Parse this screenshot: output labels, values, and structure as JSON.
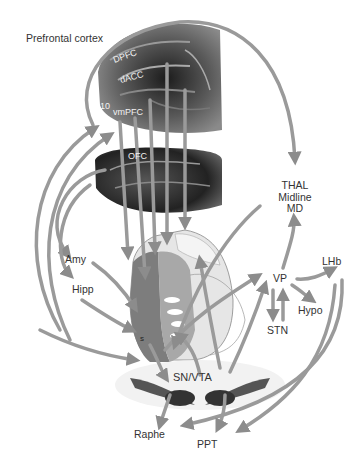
{
  "diagram": {
    "title": "Prefrontal cortex",
    "cortex_labels": {
      "dpfc": "DPFC",
      "dacc": "dACC",
      "area10": "10",
      "vmpfc": "vmPFC",
      "ofc": "OFC"
    },
    "nodes": {
      "thal_1": "THAL",
      "thal_2": "Midline",
      "thal_3": "MD",
      "vp": "VP",
      "lhb": "LHb",
      "hypo": "Hypo",
      "stn": "STN",
      "amy": "Amy",
      "hipp": "Hipp",
      "snvta": "SN/VTA",
      "raphe": "Raphe",
      "ppt": "PPT",
      "striatum_s": "s"
    },
    "colors": {
      "arrow": "#9a9a9a",
      "arrow_edge": "#7a7a7a",
      "text": "#333333",
      "brain_dark": "#3a3a3a",
      "striatum_dark": "#7d7d7d",
      "striatum_mid": "#a8a8a8",
      "striatum_light": "#d4d4d4"
    }
  }
}
